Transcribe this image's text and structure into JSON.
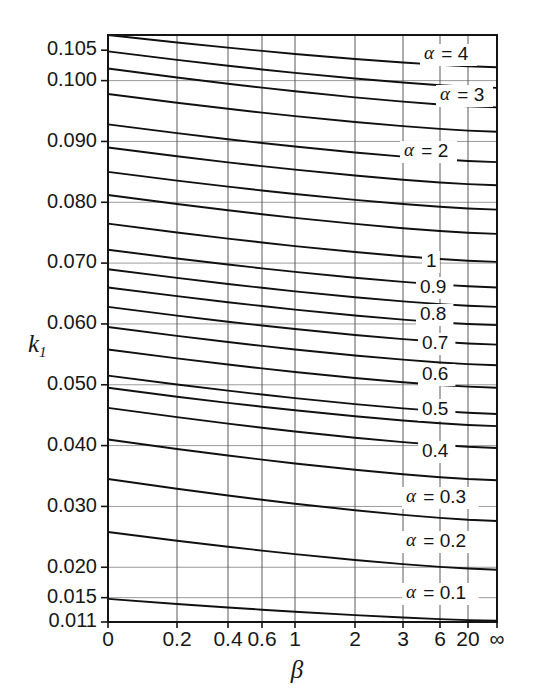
{
  "chart_data": {
    "type": "line",
    "title": "",
    "xlabel": "β",
    "ylabel": "k₁",
    "grid": true,
    "legend_position": "inline-right",
    "x_scale": "nonlinear",
    "x_ticks": [
      "0",
      "0.2",
      "0.4",
      "0.6",
      "1",
      "2",
      "3",
      "6",
      "20",
      "∞"
    ],
    "x_tick_positions": [
      0,
      0.2,
      0.4,
      0.6,
      1,
      2,
      3,
      6,
      20,
      1000
    ],
    "x_tick_px": [
      108,
      177,
      228,
      262,
      295,
      355,
      403,
      440,
      468,
      497
    ],
    "y_ticks": [
      "0.105",
      "0.100",
      "0.090",
      "0.080",
      "0.070",
      "0.060",
      "0.050",
      "0.040",
      "0.030",
      "0.020",
      "0.015",
      "0.011"
    ],
    "y_tick_values": [
      0.105,
      0.1,
      0.09,
      0.08,
      0.07,
      0.06,
      0.05,
      0.04,
      0.03,
      0.02,
      0.015,
      0.011
    ],
    "ylim": [
      0.011,
      0.1075
    ],
    "xlim_px": [
      108,
      497
    ],
    "ylim_px": [
      35,
      622
    ],
    "gridline_y_values": [
      0.1,
      0.09,
      0.08,
      0.07,
      0.06,
      0.05,
      0.04,
      0.03,
      0.02,
      0.015
    ],
    "series": [
      {
        "name": "α = 4",
        "label": "α = 4",
        "label_text": "4",
        "label_prefix": "α =",
        "y_left": 0.1075,
        "y_right": 0.1022,
        "label_x_px": 424,
        "label_y_px": 55
      },
      {
        "name": "curve-2",
        "label": "",
        "label_text": "",
        "label_prefix": "",
        "y_left": 0.1048,
        "y_right": 0.0988
      },
      {
        "name": "α = 3",
        "label": "α = 3",
        "label_text": "3",
        "label_prefix": "α =",
        "y_left": 0.102,
        "y_right": 0.0956,
        "label_x_px": 440,
        "label_y_px": 96
      },
      {
        "name": "curve-4",
        "label": "",
        "label_text": "",
        "label_prefix": "",
        "y_left": 0.0978,
        "y_right": 0.0916
      },
      {
        "name": "α = 2",
        "label": "α = 2",
        "label_text": "2",
        "label_prefix": "α =",
        "y_left": 0.0928,
        "y_right": 0.0866,
        "label_x_px": 404,
        "label_y_px": 152
      },
      {
        "name": "curve-6",
        "label": "",
        "label_text": "",
        "label_prefix": "",
        "y_left": 0.089,
        "y_right": 0.0828
      },
      {
        "name": "curve-7",
        "label": "",
        "label_text": "",
        "label_prefix": "",
        "y_left": 0.085,
        "y_right": 0.0788
      },
      {
        "name": "curve-8",
        "label": "",
        "label_text": "",
        "label_prefix": "",
        "y_left": 0.0812,
        "y_right": 0.0748
      },
      {
        "name": "curve-9",
        "label": "",
        "label_text": "",
        "label_prefix": "",
        "y_left": 0.0765,
        "y_right": 0.0702
      },
      {
        "name": "curve-10",
        "label": "",
        "label_text": "",
        "label_prefix": "",
        "y_left": 0.0722,
        "y_right": 0.066
      },
      {
        "name": "1",
        "label": "1",
        "label_text": "1",
        "label_prefix": "",
        "y_left": 0.069,
        "y_right": 0.0628,
        "label_x_px": 426,
        "label_y_px": 262
      },
      {
        "name": "0.9",
        "label": "0.9",
        "label_text": "0.9",
        "label_prefix": "",
        "y_left": 0.066,
        "y_right": 0.0598,
        "label_x_px": 420,
        "label_y_px": 288
      },
      {
        "name": "0.8",
        "label": "0.8",
        "label_text": "0.8",
        "label_prefix": "",
        "y_left": 0.0628,
        "y_right": 0.0566,
        "label_x_px": 420,
        "label_y_px": 315
      },
      {
        "name": "0.7",
        "label": "0.7",
        "label_text": "0.7",
        "label_prefix": "",
        "y_left": 0.0595,
        "y_right": 0.0532,
        "label_x_px": 422,
        "label_y_px": 344
      },
      {
        "name": "0.6",
        "label": "0.6",
        "label_text": "0.6",
        "label_prefix": "",
        "y_left": 0.0558,
        "y_right": 0.0495,
        "label_x_px": 422,
        "label_y_px": 375
      },
      {
        "name": "0.5",
        "label": "0.5",
        "label_text": "0.5",
        "label_prefix": "",
        "y_left": 0.0515,
        "y_right": 0.0452,
        "label_x_px": 422,
        "label_y_px": 410
      },
      {
        "name": "curve-17",
        "label": "",
        "label_text": "",
        "label_prefix": "",
        "y_left": 0.0495,
        "y_right": 0.0432
      },
      {
        "name": "0.4",
        "label": "0.4",
        "label_text": "0.4",
        "label_prefix": "",
        "y_left": 0.0462,
        "y_right": 0.0396,
        "label_x_px": 422,
        "label_y_px": 452
      },
      {
        "name": "α = 0.3",
        "label": "α = 0.3",
        "label_text": "0.3",
        "label_prefix": "α =",
        "y_left": 0.041,
        "y_right": 0.0343,
        "label_x_px": 406,
        "label_y_px": 498
      },
      {
        "name": "α = 0.2",
        "label": "α = 0.2",
        "label_text": "0.2",
        "label_prefix": "α =",
        "y_left": 0.0345,
        "y_right": 0.0276,
        "label_x_px": 406,
        "label_y_px": 542
      },
      {
        "name": "curve-21",
        "label": "",
        "label_text": "",
        "label_prefix": "",
        "y_left": 0.0258,
        "y_right": 0.0196
      },
      {
        "name": "α = 0.1",
        "label": "α = 0.1",
        "label_text": "0.1",
        "label_prefix": "α =",
        "y_left": 0.0148,
        "y_right": 0.0112,
        "label_x_px": 406,
        "label_y_px": 594
      }
    ]
  }
}
